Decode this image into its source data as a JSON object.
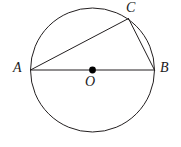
{
  "figure": {
    "background_color": "#ffffff",
    "stroke_color": "#231f20",
    "fill_color": "#000000",
    "labels": {
      "A": "A",
      "B": "B",
      "C": "C",
      "O": "O"
    }
  },
  "chart_data": {
    "type": "diagram",
    "xlabel": "",
    "ylabel": "",
    "xlim": [
      0,
      181
    ],
    "ylim": [
      0,
      147
    ],
    "grid": false,
    "legend": "none",
    "shapes": [
      {
        "name": "circle",
        "kind": "circle",
        "center": [
          92.5,
          70
        ],
        "radius": 62,
        "stroke": "#231f20",
        "stroke_width": 1,
        "fill": "none"
      },
      {
        "name": "segment-AB",
        "kind": "line",
        "from": [
          30.5,
          70
        ],
        "to": [
          154.5,
          70
        ],
        "stroke": "#231f20",
        "stroke_width": 1
      },
      {
        "name": "segment-AC",
        "kind": "line",
        "from": [
          30.5,
          70
        ],
        "to": [
          128.5,
          18.5
        ],
        "stroke": "#231f20",
        "stroke_width": 1
      },
      {
        "name": "segment-CB",
        "kind": "line",
        "from": [
          128.5,
          18.5
        ],
        "to": [
          154.5,
          70
        ],
        "stroke": "#231f20",
        "stroke_width": 1
      },
      {
        "name": "center-dot",
        "kind": "dot",
        "center": [
          92.5,
          70
        ],
        "radius": 3.4,
        "fill": "#000000"
      }
    ],
    "points": [
      {
        "label": "A",
        "x": 30.5,
        "y": 70,
        "label_x": 19,
        "label_y": 69,
        "on": "circle"
      },
      {
        "label": "B",
        "x": 154.5,
        "y": 70,
        "label_x": 166,
        "label_y": 69,
        "on": "circle"
      },
      {
        "label": "C",
        "x": 128.5,
        "y": 18.5,
        "label_x": 132,
        "label_y": 9,
        "on": "circle"
      },
      {
        "label": "O",
        "x": 92.5,
        "y": 70,
        "label_x": 91,
        "label_y": 83,
        "on": "center"
      }
    ]
  }
}
